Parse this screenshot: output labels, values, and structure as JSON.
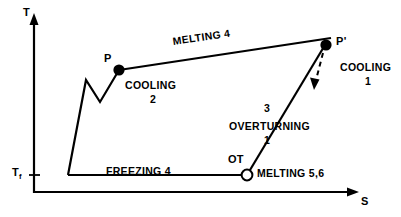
{
  "figure": {
    "type": "phase-diagram",
    "background_color": "#ffffff",
    "stroke_color": "#000000"
  },
  "axes": {
    "y_label": "T",
    "y_label_sub": "",
    "x_label": "S",
    "y_tick_label_main": "T",
    "y_tick_label_sub": "f"
  },
  "points": [
    {
      "id": "P",
      "label": "P",
      "marker": "filled-dot"
    },
    {
      "id": "Pp",
      "label": "P'",
      "marker": "filled-dot"
    },
    {
      "id": "OT",
      "label": "OT",
      "marker": "open-circle"
    }
  ],
  "process_labels": {
    "melting_4": "MELTING 4",
    "cooling_2_name": "COOLING",
    "cooling_2_num": "2",
    "cooling_1_name": "COOLING",
    "cooling_1_num": "1",
    "freezing_4": "FREEZING 4",
    "overturning_name": "OVERTURNING",
    "overturning_num": "1",
    "overturning_top_num": "3",
    "melting_56": "MELTING 5,6"
  }
}
